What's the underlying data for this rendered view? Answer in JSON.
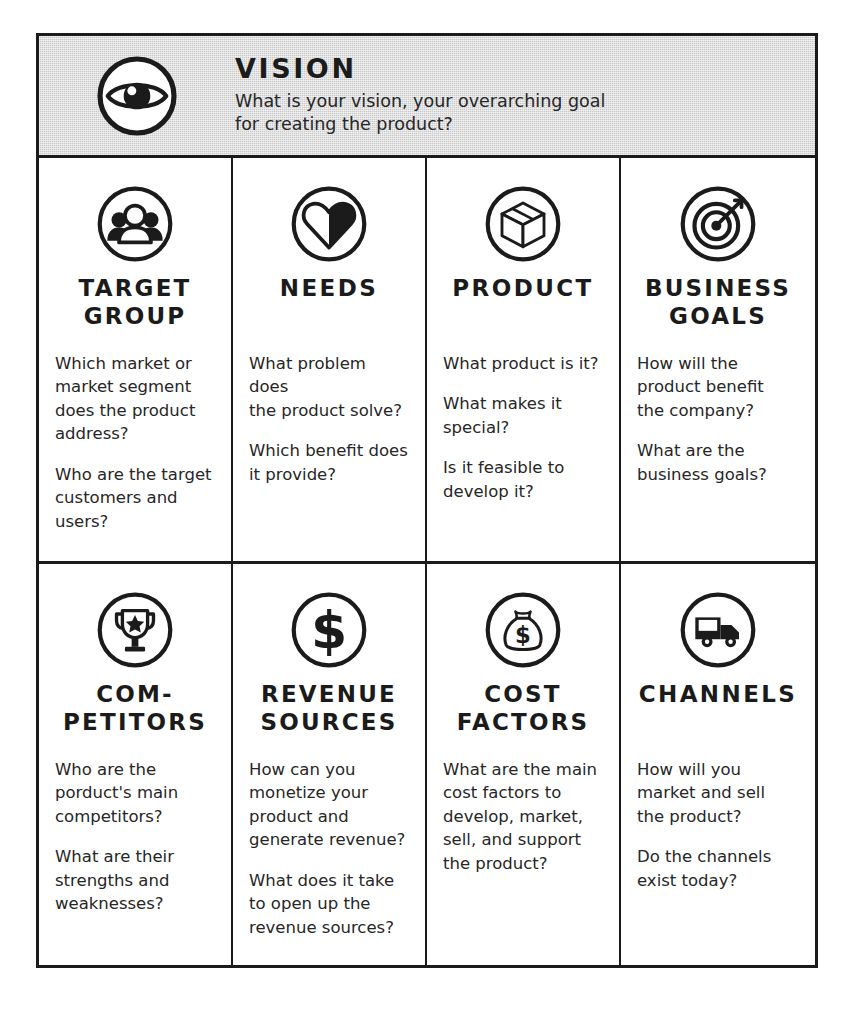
{
  "vision": {
    "icon": "eye-icon",
    "title": "VISION",
    "description": "What is your vision, your overarching goal\nfor creating the product?"
  },
  "cells": [
    {
      "icon": "people-group-icon",
      "title": "TARGET\nGROUP",
      "paragraphs": [
        "Which market or\nmarket segment\ndoes the product\naddress?",
        "Who are the target\ncustomers and\nusers?"
      ]
    },
    {
      "icon": "heart-icon",
      "title": "NEEDS",
      "paragraphs": [
        "What problem does\nthe product solve?",
        "Which benefit does\nit provide?"
      ]
    },
    {
      "icon": "box-icon",
      "title": "PRODUCT",
      "paragraphs": [
        "What product is it?",
        "What makes it\nspecial?",
        "Is it feasible to\ndevelop it?"
      ]
    },
    {
      "icon": "target-icon",
      "title": "BUSINESS\nGOALS",
      "paragraphs": [
        "How will the\nproduct benefit\nthe company?",
        "What are the\nbusiness goals?"
      ]
    },
    {
      "icon": "trophy-icon",
      "title": "COM-\nPETITORS",
      "paragraphs": [
        "Who are the\nporduct's main\ncompetitors?",
        "What are their\nstrengths and\nweaknesses?"
      ]
    },
    {
      "icon": "dollar-sign-icon",
      "title": "REVENUE\nSOURCES",
      "paragraphs": [
        "How can you\nmonetize your\nproduct and\ngenerate revenue?",
        "What does it take\nto open up the\nrevenue sources?"
      ]
    },
    {
      "icon": "money-bag-icon",
      "title": "COST\nFACTORS",
      "paragraphs": [
        "What are the main\ncost factors to\ndevelop, market,\nsell, and support\nthe product?"
      ]
    },
    {
      "icon": "delivery-truck-icon",
      "title": "CHANNELS",
      "paragraphs": [
        "How will you\nmarket and sell\nthe product?",
        "Do the channels\nexist today?"
      ]
    }
  ],
  "colors": {
    "ink": "#1b1b1b",
    "header_background": "#c9c9c9",
    "page_background": "#ffffff"
  }
}
